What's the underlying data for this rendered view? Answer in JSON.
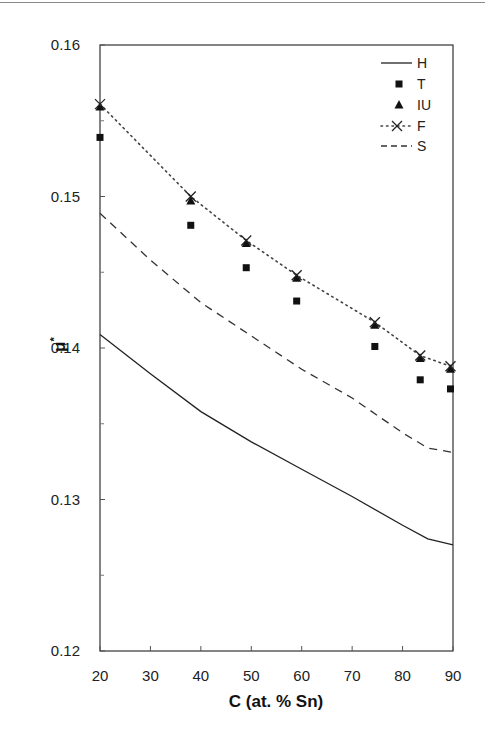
{
  "chart_data": {
    "type": "line",
    "title": "",
    "xlabel": "C (at. % Sn)",
    "ylabel": "μ*",
    "xlim": [
      20,
      90
    ],
    "ylim": [
      0.12,
      0.16
    ],
    "xticks": [
      "20",
      "30",
      "40",
      "50",
      "60",
      "70",
      "80",
      "90"
    ],
    "yticks": [
      "0.12",
      "0.13",
      "0.14",
      "0.15",
      "0.16"
    ],
    "grid": false,
    "legend_position": "upper right",
    "series": [
      {
        "name": "H",
        "style": "solid line",
        "x": [
          20,
          30,
          40,
          50,
          60,
          70,
          80,
          85,
          90
        ],
        "y": [
          0.1409,
          0.1383,
          0.1358,
          0.1338,
          0.132,
          0.1302,
          0.1283,
          0.1274,
          0.127
        ]
      },
      {
        "name": "T",
        "style": "square markers",
        "x": [
          19.3,
          38,
          49,
          59,
          74.5,
          83.5,
          89.5
        ],
        "y": [
          0.1539,
          0.1481,
          0.1453,
          0.1431,
          0.1401,
          0.1379,
          0.1373
        ]
      },
      {
        "name": "IU",
        "style": "triangle markers",
        "x": [
          19.3,
          38,
          49,
          59,
          74.5,
          83.5,
          89.5
        ],
        "y": [
          0.1559,
          0.1497,
          0.1469,
          0.1446,
          0.1415,
          0.1393,
          0.1386
        ]
      },
      {
        "name": "F",
        "style": "dotted line with x markers",
        "x": [
          19.3,
          38,
          49,
          59,
          74.5,
          83.5,
          89.5
        ],
        "y": [
          0.1561,
          0.15,
          0.1471,
          0.1448,
          0.1417,
          0.1395,
          0.1388
        ]
      },
      {
        "name": "S",
        "style": "dashed line",
        "x": [
          20,
          30,
          40,
          50,
          60,
          70,
          80,
          85,
          90
        ],
        "y": [
          0.1489,
          0.1458,
          0.143,
          0.1408,
          0.1386,
          0.1367,
          0.1344,
          0.1334,
          0.1331
        ]
      }
    ]
  },
  "legend": {
    "entries": [
      "H",
      "T",
      "IU",
      "F",
      "S"
    ]
  },
  "axes": {
    "xlabel": "C (at. % Sn)",
    "ylabel_main": "μ",
    "ylabel_sup": "*"
  },
  "colors": {
    "line": "#222222",
    "frame": "#333333",
    "background": "#ffffff"
  }
}
